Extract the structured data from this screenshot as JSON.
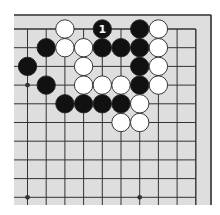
{
  "diagram": {
    "type": "go-board-partial",
    "view": "top-right corner",
    "columns": 10,
    "rows": 10,
    "colors": {
      "board": "#dedede",
      "line": "#333333",
      "black_stone": "#111111",
      "white_stone": "#ffffff",
      "stone_outline": "#222222",
      "label_on_black": "#ffffff"
    },
    "star_points": [
      {
        "col": 0,
        "row": 3
      },
      {
        "col": 0,
        "row": 9
      },
      {
        "col": 6,
        "row": 9
      }
    ],
    "stones": [
      {
        "col": 2,
        "row": 0,
        "color": "white"
      },
      {
        "col": 4,
        "row": 0,
        "color": "black",
        "label": "1"
      },
      {
        "col": 6,
        "row": 0,
        "color": "black"
      },
      {
        "col": 7,
        "row": 0,
        "color": "white"
      },
      {
        "col": 1,
        "row": 1,
        "color": "black"
      },
      {
        "col": 2,
        "row": 1,
        "color": "white"
      },
      {
        "col": 3,
        "row": 1,
        "color": "white"
      },
      {
        "col": 4,
        "row": 1,
        "color": "black"
      },
      {
        "col": 5,
        "row": 1,
        "color": "black"
      },
      {
        "col": 6,
        "row": 1,
        "color": "black"
      },
      {
        "col": 7,
        "row": 1,
        "color": "white"
      },
      {
        "col": 0,
        "row": 2,
        "color": "black"
      },
      {
        "col": 3,
        "row": 2,
        "color": "white"
      },
      {
        "col": 6,
        "row": 2,
        "color": "black"
      },
      {
        "col": 7,
        "row": 2,
        "color": "white"
      },
      {
        "col": 1,
        "row": 3,
        "color": "black"
      },
      {
        "col": 3,
        "row": 3,
        "color": "white"
      },
      {
        "col": 4,
        "row": 3,
        "color": "white"
      },
      {
        "col": 5,
        "row": 3,
        "color": "white"
      },
      {
        "col": 6,
        "row": 3,
        "color": "black"
      },
      {
        "col": 7,
        "row": 3,
        "color": "white"
      },
      {
        "col": 2,
        "row": 4,
        "color": "black"
      },
      {
        "col": 3,
        "row": 4,
        "color": "black"
      },
      {
        "col": 4,
        "row": 4,
        "color": "black"
      },
      {
        "col": 5,
        "row": 4,
        "color": "black"
      },
      {
        "col": 6,
        "row": 4,
        "color": "white"
      },
      {
        "col": 5,
        "row": 5,
        "color": "white"
      },
      {
        "col": 6,
        "row": 5,
        "color": "white"
      }
    ]
  }
}
